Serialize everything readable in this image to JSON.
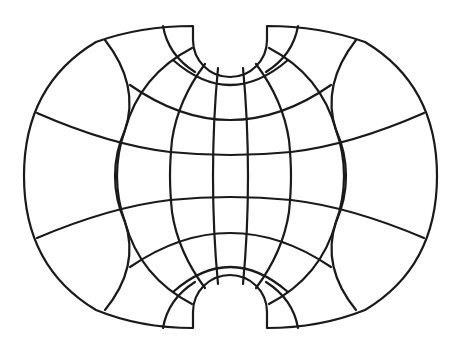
{
  "diagram": {
    "type": "map-projection-graticule",
    "stroke_color": "#1a1a1a",
    "background_color": "#ffffff",
    "meridian_count": 8,
    "parallel_count": 7
  }
}
